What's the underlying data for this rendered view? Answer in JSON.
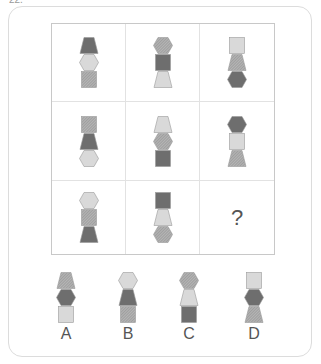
{
  "question_number": "22.",
  "colors": {
    "dark": "#6e6e6e",
    "light": "#d9d9d9",
    "hatch_base": "#b5b5b5",
    "hatch_line": "#8a8a8a",
    "stroke": "#9a9a9a"
  },
  "grid": {
    "cells": [
      {
        "stack": [
          {
            "shape": "trapezoid",
            "fill": "dark"
          },
          {
            "shape": "hexagon",
            "fill": "light"
          },
          {
            "shape": "square",
            "fill": "hatch"
          }
        ]
      },
      {
        "stack": [
          {
            "shape": "hexagon",
            "fill": "hatch"
          },
          {
            "shape": "square",
            "fill": "dark"
          },
          {
            "shape": "trapezoid",
            "fill": "light"
          }
        ]
      },
      {
        "stack": [
          {
            "shape": "square",
            "fill": "light"
          },
          {
            "shape": "trapezoid",
            "fill": "hatch"
          },
          {
            "shape": "hexagon",
            "fill": "dark"
          }
        ]
      },
      {
        "stack": [
          {
            "shape": "square",
            "fill": "hatch"
          },
          {
            "shape": "trapezoid",
            "fill": "dark"
          },
          {
            "shape": "hexagon",
            "fill": "light"
          }
        ]
      },
      {
        "stack": [
          {
            "shape": "trapezoid",
            "fill": "light"
          },
          {
            "shape": "hexagon",
            "fill": "hatch"
          },
          {
            "shape": "square",
            "fill": "dark"
          }
        ]
      },
      {
        "stack": [
          {
            "shape": "hexagon",
            "fill": "dark"
          },
          {
            "shape": "square",
            "fill": "light"
          },
          {
            "shape": "trapezoid",
            "fill": "hatch"
          }
        ]
      },
      {
        "stack": [
          {
            "shape": "hexagon",
            "fill": "light"
          },
          {
            "shape": "square",
            "fill": "hatch"
          },
          {
            "shape": "trapezoid",
            "fill": "dark"
          }
        ]
      },
      {
        "stack": [
          {
            "shape": "square",
            "fill": "dark"
          },
          {
            "shape": "trapezoid",
            "fill": "light"
          },
          {
            "shape": "hexagon",
            "fill": "hatch"
          }
        ]
      },
      {
        "question_mark": "?"
      }
    ]
  },
  "options": [
    {
      "label": "A",
      "stack": [
        {
          "shape": "trapezoid",
          "fill": "hatch"
        },
        {
          "shape": "hexagon",
          "fill": "dark"
        },
        {
          "shape": "square",
          "fill": "light"
        }
      ]
    },
    {
      "label": "B",
      "stack": [
        {
          "shape": "hexagon",
          "fill": "light"
        },
        {
          "shape": "trapezoid",
          "fill": "dark"
        },
        {
          "shape": "square",
          "fill": "hatch"
        }
      ]
    },
    {
      "label": "C",
      "stack": [
        {
          "shape": "hexagon",
          "fill": "hatch"
        },
        {
          "shape": "trapezoid",
          "fill": "light"
        },
        {
          "shape": "square",
          "fill": "dark"
        }
      ]
    },
    {
      "label": "D",
      "stack": [
        {
          "shape": "square",
          "fill": "light"
        },
        {
          "shape": "hexagon",
          "fill": "dark"
        },
        {
          "shape": "trapezoid",
          "fill": "hatch"
        }
      ]
    }
  ]
}
